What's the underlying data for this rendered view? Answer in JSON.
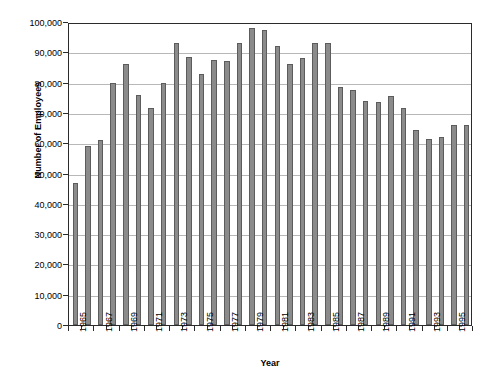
{
  "chart_data": {
    "type": "bar",
    "title": "",
    "xlabel": "Year",
    "ylabel": "Number of Employees",
    "ylim": [
      0,
      100000
    ],
    "ytick_step": 10000,
    "grid": true,
    "legend": "none",
    "bar_color": "#8b8b8b",
    "bar_border_color": "#5c5c5c",
    "gridline_color": "#b8b8b8",
    "axis_color": "#2b2b2b",
    "ytick_labels": [
      "100,000",
      "90,000",
      "80,000",
      "70,000",
      "60,000",
      "50,000",
      "40,000",
      "30,000",
      "20,000",
      "10,000",
      "0"
    ],
    "ytick_values": [
      100000,
      90000,
      80000,
      70000,
      60000,
      50000,
      40000,
      30000,
      20000,
      10000,
      0
    ],
    "xtick_labels": [
      "1965",
      "1967",
      "1969",
      "1971",
      "1973",
      "1975",
      "1977",
      "1979",
      "1981",
      "1983",
      "1985",
      "1987",
      "1989",
      "1991",
      "1993",
      "1995"
    ],
    "categories": [
      "1965",
      "1966",
      "1967",
      "1968",
      "1969",
      "1970",
      "1971",
      "1972",
      "1973",
      "1974",
      "1975",
      "1976",
      "1977",
      "1978",
      "1979",
      "1980",
      "1981",
      "1982",
      "1983",
      "1984",
      "1985",
      "1986",
      "1987",
      "1988",
      "1989",
      "1990",
      "1991",
      "1992",
      "1993",
      "1994",
      "1995",
      "1996"
    ],
    "values": [
      47000,
      59000,
      61000,
      80000,
      86000,
      76000,
      71500,
      80000,
      93000,
      88500,
      83000,
      87500,
      87000,
      93000,
      98000,
      97500,
      92000,
      86000,
      88000,
      93000,
      93000,
      78500,
      77500,
      74000,
      73500,
      75500,
      71500,
      64500,
      61500,
      62000,
      66000,
      66000
    ]
  }
}
